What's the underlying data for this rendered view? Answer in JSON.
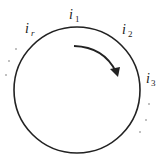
{
  "diagram": {
    "type": "circular-ordering",
    "labels": [
      {
        "id": "i1",
        "base": "i",
        "sub": "1"
      },
      {
        "id": "i2",
        "base": "i",
        "sub": "2"
      },
      {
        "id": "i3",
        "base": "i",
        "sub": "3"
      },
      {
        "id": "ir",
        "base": "i",
        "sub": "r"
      }
    ],
    "arrow_direction": "clockwise",
    "stroke_color": "#222222"
  }
}
